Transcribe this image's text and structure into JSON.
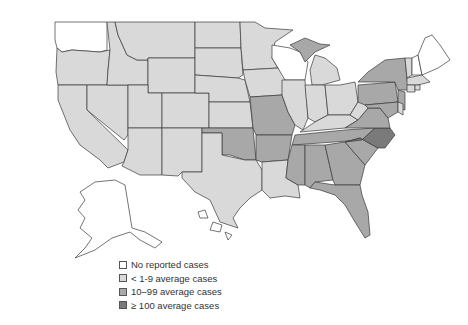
{
  "legend": {
    "items": [
      {
        "label": "No reported cases",
        "color": "#ffffff",
        "category": "none"
      },
      {
        "label": "< 1-9 average cases",
        "color": "#d9d9d9",
        "category": "low"
      },
      {
        "label": "10–99 average cases",
        "color": "#a8a8a8",
        "category": "mid"
      },
      {
        "label": "≥ 100 average cases",
        "color": "#7a7a7a",
        "category": "high"
      }
    ]
  },
  "colors": {
    "none": "#ffffff",
    "low": "#d9d9d9",
    "mid": "#a8a8a8",
    "high": "#7a7a7a"
  },
  "states": {
    "none": [
      "WA",
      "WI",
      "ME",
      "NH",
      "AK",
      "HI"
    ],
    "low": [
      "OR",
      "CA",
      "ID",
      "NV",
      "MT",
      "WY",
      "UT",
      "AZ",
      "CO",
      "NM",
      "ND",
      "SD",
      "NE",
      "KS",
      "TX",
      "MN",
      "IA",
      "IL",
      "IN",
      "OH",
      "KY",
      "WV",
      "LA",
      "MI-lower",
      "VT",
      "MA",
      "RI",
      "CT",
      "DE"
    ],
    "mid": [
      "OK",
      "MO",
      "AR",
      "MS",
      "AL",
      "GA",
      "SC",
      "FL",
      "TN",
      "VA",
      "PA",
      "NY",
      "NJ",
      "MD",
      "MI-upper"
    ],
    "high": [
      "NC"
    ]
  }
}
